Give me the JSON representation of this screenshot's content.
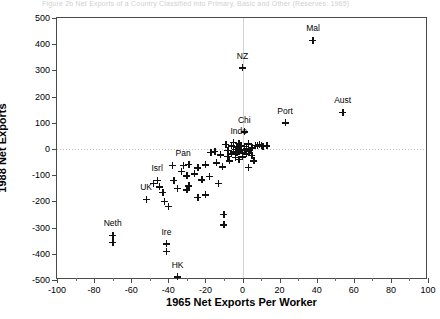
{
  "page": {
    "cutoff_header": "Figure 2b   Net Exports of a Country Classified into Primary, Basic and Other (Reserves: 1965)"
  },
  "chart_data": {
    "type": "scatter",
    "title": "",
    "xlabel": "1965 Net Exports Per Worker",
    "ylabel": "1988 Net Exports",
    "xlim": [
      -100,
      100
    ],
    "ylim": [
      -500,
      500
    ],
    "xticks": [
      -100,
      -80,
      -60,
      -40,
      -20,
      0,
      20,
      40,
      60,
      80,
      100
    ],
    "yticks": [
      -500,
      -400,
      -300,
      -200,
      -100,
      0,
      100,
      200,
      300,
      400,
      500
    ],
    "xtick_labels": [
      "-100",
      "-80",
      "-60",
      "-40",
      "-20",
      "0",
      "20",
      "40",
      "60",
      "80",
      "100"
    ],
    "ytick_labels": [
      "-500",
      "-400",
      "-300",
      "-200",
      "-100",
      "0",
      "100",
      "200",
      "300",
      "400",
      "500"
    ],
    "grid": "zero-lines-only",
    "legend": "none",
    "marker": "plus",
    "marker_color": "#111111",
    "labeled_points": [
      {
        "label": "Mal",
        "x": 38,
        "y": 415,
        "label_dx": 0,
        "label_dy": -8
      },
      {
        "label": "NZ",
        "x": 0,
        "y": 310,
        "label_dx": 0,
        "label_dy": -8
      },
      {
        "label": "Aust",
        "x": 54,
        "y": 140,
        "label_dx": 0,
        "label_dy": -8
      },
      {
        "label": "Port",
        "x": 23,
        "y": 100,
        "label_dx": 0,
        "label_dy": -8
      },
      {
        "label": "Chi",
        "x": 1,
        "y": 65,
        "label_dx": 0,
        "label_dy": -8
      },
      {
        "label": "Indo",
        "x": -2,
        "y": 22,
        "label_dx": 0,
        "label_dy": -8
      },
      {
        "label": "Pan",
        "x": -32,
        "y": -62,
        "label_dx": 0,
        "label_dy": -8
      },
      {
        "label": "Isrl",
        "x": -46,
        "y": -120,
        "label_dx": 0,
        "label_dy": -8
      },
      {
        "label": "UK",
        "x": -52,
        "y": -192,
        "label_dx": 0,
        "label_dy": -8
      },
      {
        "label": "Neth",
        "x": -70,
        "y": -330,
        "label_dx": 0,
        "label_dy": -8
      },
      {
        "label": "Ire",
        "x": -41,
        "y": -362,
        "label_dx": 0,
        "label_dy": -8
      },
      {
        "label": "HK",
        "x": -35,
        "y": -488,
        "label_dx": 0,
        "label_dy": -8
      }
    ],
    "unlabeled_points": [
      {
        "x": -70,
        "y": -355
      },
      {
        "x": -41,
        "y": -390
      },
      {
        "x": -38,
        "y": -62
      },
      {
        "x": -33,
        "y": -85
      },
      {
        "x": -29,
        "y": -58
      },
      {
        "x": -30,
        "y": -102
      },
      {
        "x": -29,
        "y": -140
      },
      {
        "x": -30,
        "y": -155
      },
      {
        "x": -45,
        "y": -145
      },
      {
        "x": -43,
        "y": -165
      },
      {
        "x": -42,
        "y": -200
      },
      {
        "x": -40,
        "y": -218
      },
      {
        "x": -48,
        "y": -132
      },
      {
        "x": -37,
        "y": -120
      },
      {
        "x": -35,
        "y": -150
      },
      {
        "x": -26,
        "y": -95
      },
      {
        "x": -24,
        "y": -72
      },
      {
        "x": -22,
        "y": -118
      },
      {
        "x": -20,
        "y": -60
      },
      {
        "x": -18,
        "y": -105
      },
      {
        "x": -17,
        "y": -12
      },
      {
        "x": -15,
        "y": -8
      },
      {
        "x": -14,
        "y": -52
      },
      {
        "x": -13,
        "y": -130
      },
      {
        "x": -12,
        "y": -22
      },
      {
        "x": -11,
        "y": -68
      },
      {
        "x": -10,
        "y": -250
      },
      {
        "x": -10,
        "y": -290
      },
      {
        "x": -9,
        "y": 18
      },
      {
        "x": -8,
        "y": -28
      },
      {
        "x": -8,
        "y": -5
      },
      {
        "x": -7,
        "y": -45
      },
      {
        "x": -6,
        "y": 12
      },
      {
        "x": -6,
        "y": -18
      },
      {
        "x": -5,
        "y": -10
      },
      {
        "x": -5,
        "y": 25
      },
      {
        "x": -4,
        "y": -32
      },
      {
        "x": -4,
        "y": -2
      },
      {
        "x": -3,
        "y": -15
      },
      {
        "x": -3,
        "y": 8
      },
      {
        "x": -2,
        "y": -8
      },
      {
        "x": -2,
        "y": -40
      },
      {
        "x": -1,
        "y": -5
      },
      {
        "x": -1,
        "y": 14
      },
      {
        "x": 0,
        "y": -12
      },
      {
        "x": 0,
        "y": -30
      },
      {
        "x": 1,
        "y": -3
      },
      {
        "x": 1,
        "y": 10
      },
      {
        "x": 2,
        "y": -18
      },
      {
        "x": 2,
        "y": 2
      },
      {
        "x": 3,
        "y": -8
      },
      {
        "x": 3,
        "y": 20
      },
      {
        "x": 4,
        "y": -6
      },
      {
        "x": 5,
        "y": -25
      },
      {
        "x": 5,
        "y": 5
      },
      {
        "x": 6,
        "y": -45
      },
      {
        "x": 7,
        "y": 14
      },
      {
        "x": 8,
        "y": 12
      },
      {
        "x": 9,
        "y": 16
      },
      {
        "x": 10,
        "y": 14
      },
      {
        "x": 11,
        "y": 10
      },
      {
        "x": 13,
        "y": 12
      },
      {
        "x": 3,
        "y": -70
      },
      {
        "x": -20,
        "y": -175
      },
      {
        "x": -24,
        "y": -185
      }
    ]
  }
}
